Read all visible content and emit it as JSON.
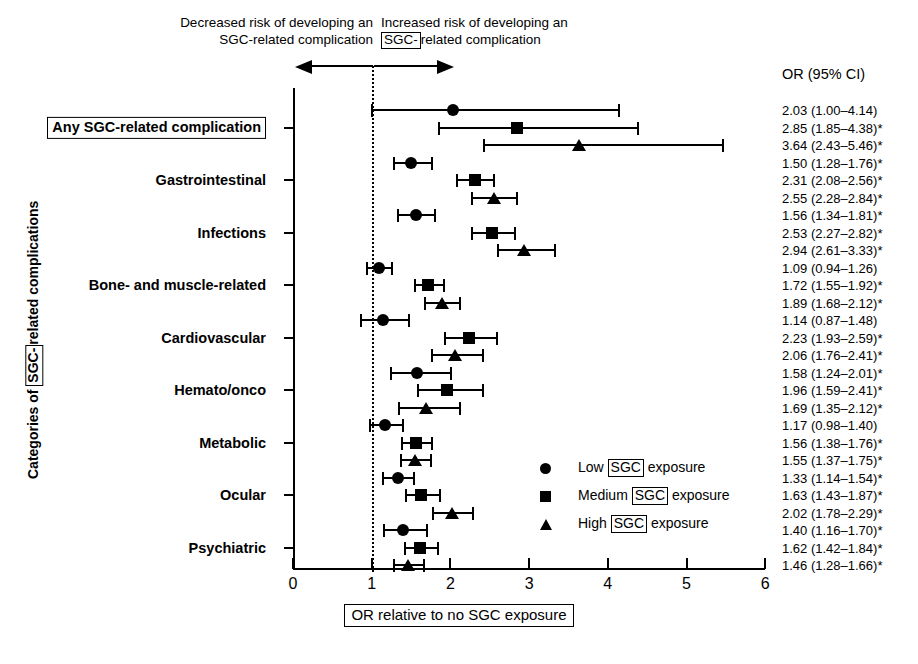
{
  "header": {
    "left_line1": "Decreased risk of developing an",
    "left_line2_pre": "SGC-related complication",
    "right_line1": "Increased risk of developing an",
    "right_boxed": "SGC-",
    "right_after": "related complication"
  },
  "axes": {
    "x_title_text": "OR relative to no SGC exposure",
    "y_title_pre": "Categories of ",
    "y_title_boxed": "SGC-",
    "y_title_post": "related complications",
    "x_ticks": [
      "0",
      "1",
      "2",
      "3",
      "4",
      "5",
      "6"
    ],
    "x_min": 0,
    "x_max": 6,
    "reference_value": 1
  },
  "or_column": {
    "header": "OR (95% CI)"
  },
  "legend": {
    "items": [
      {
        "marker": "circle-marker",
        "pre": "Low ",
        "boxed": "SGC",
        "post": " exposure"
      },
      {
        "marker": "square-marker",
        "pre": "Medium ",
        "boxed": "SGC",
        "post": " exposure"
      },
      {
        "marker": "triangle-marker",
        "pre": "High ",
        "boxed": "SGC",
        "post": " exposure"
      }
    ]
  },
  "chart_data": {
    "type": "scatter",
    "title": "",
    "xlabel": "OR relative to no SGC exposure",
    "ylabel": "Categories of SGC-related complications",
    "xlim": [
      0,
      6
    ],
    "grid": false,
    "reference_line": 1,
    "legend_position": "inside-right",
    "series": [
      {
        "name": "Low SGC exposure",
        "marker": "circle"
      },
      {
        "name": "Medium SGC exposure",
        "marker": "square"
      },
      {
        "name": "High SGC exposure",
        "marker": "triangle"
      }
    ],
    "categories": [
      "Any SGC-related complication",
      "Gastrointestinal",
      "Infections",
      "Bone- and muscle-related",
      "Cardiovascular",
      "Hemato/onco",
      "Metabolic",
      "Ocular",
      "Psychiatric"
    ],
    "groups": [
      {
        "category": "Any SGC-related complication",
        "boxed_label": true,
        "rows": [
          {
            "series": "Low SGC exposure",
            "or": 2.03,
            "ci_low": 1.0,
            "ci_high": 4.14,
            "significant": false,
            "text": "2.03 (1.00–4.14)"
          },
          {
            "series": "Medium SGC exposure",
            "or": 2.85,
            "ci_low": 1.85,
            "ci_high": 4.38,
            "significant": true,
            "text": "2.85 (1.85–4.38)*"
          },
          {
            "series": "High SGC exposure",
            "or": 3.64,
            "ci_low": 2.43,
            "ci_high": 5.46,
            "significant": true,
            "text": "3.64 (2.43–5.46)*"
          }
        ]
      },
      {
        "category": "Gastrointestinal",
        "boxed_label": false,
        "rows": [
          {
            "series": "Low SGC exposure",
            "or": 1.5,
            "ci_low": 1.28,
            "ci_high": 1.76,
            "significant": true,
            "text": "1.50 (1.28–1.76)*"
          },
          {
            "series": "Medium SGC exposure",
            "or": 2.31,
            "ci_low": 2.08,
            "ci_high": 2.56,
            "significant": true,
            "text": "2.31 (2.08–2.56)*"
          },
          {
            "series": "High SGC exposure",
            "or": 2.55,
            "ci_low": 2.28,
            "ci_high": 2.84,
            "significant": true,
            "text": "2.55 (2.28–2.84)*"
          }
        ]
      },
      {
        "category": "Infections",
        "boxed_label": false,
        "rows": [
          {
            "series": "Low SGC exposure",
            "or": 1.56,
            "ci_low": 1.34,
            "ci_high": 1.81,
            "significant": true,
            "text": "1.56 (1.34–1.81)*"
          },
          {
            "series": "Medium SGC exposure",
            "or": 2.53,
            "ci_low": 2.27,
            "ci_high": 2.82,
            "significant": true,
            "text": "2.53 (2.27–2.82)*"
          },
          {
            "series": "High SGC exposure",
            "or": 2.94,
            "ci_low": 2.61,
            "ci_high": 3.33,
            "significant": true,
            "text": "2.94 (2.61–3.33)*"
          }
        ]
      },
      {
        "category": "Bone- and muscle-related",
        "boxed_label": false,
        "rows": [
          {
            "series": "Low SGC exposure",
            "or": 1.09,
            "ci_low": 0.94,
            "ci_high": 1.26,
            "significant": false,
            "text": "1.09 (0.94–1.26)"
          },
          {
            "series": "Medium SGC exposure",
            "or": 1.72,
            "ci_low": 1.55,
            "ci_high": 1.92,
            "significant": true,
            "text": "1.72 (1.55–1.92)*"
          },
          {
            "series": "High SGC exposure",
            "or": 1.89,
            "ci_low": 1.68,
            "ci_high": 2.12,
            "significant": true,
            "text": "1.89 (1.68–2.12)*"
          }
        ]
      },
      {
        "category": "Cardiovascular",
        "boxed_label": false,
        "rows": [
          {
            "series": "Low SGC exposure",
            "or": 1.14,
            "ci_low": 0.87,
            "ci_high": 1.48,
            "significant": false,
            "text": "1.14 (0.87–1.48)"
          },
          {
            "series": "Medium SGC exposure",
            "or": 2.23,
            "ci_low": 1.93,
            "ci_high": 2.59,
            "significant": true,
            "text": "2.23 (1.93–2.59)*"
          },
          {
            "series": "High SGC exposure",
            "or": 2.06,
            "ci_low": 1.76,
            "ci_high": 2.41,
            "significant": true,
            "text": "2.06 (1.76–2.41)*"
          }
        ]
      },
      {
        "category": "Hemato/onco",
        "boxed_label": false,
        "rows": [
          {
            "series": "Low SGC exposure",
            "or": 1.58,
            "ci_low": 1.24,
            "ci_high": 2.01,
            "significant": true,
            "text": "1.58 (1.24–2.01)*"
          },
          {
            "series": "Medium SGC exposure",
            "or": 1.96,
            "ci_low": 1.59,
            "ci_high": 2.41,
            "significant": true,
            "text": "1.96 (1.59–2.41)*"
          },
          {
            "series": "High SGC exposure",
            "or": 1.69,
            "ci_low": 1.35,
            "ci_high": 2.12,
            "significant": true,
            "text": "1.69 (1.35–2.12)*"
          }
        ]
      },
      {
        "category": "Metabolic",
        "boxed_label": false,
        "rows": [
          {
            "series": "Low SGC exposure",
            "or": 1.17,
            "ci_low": 0.98,
            "ci_high": 1.4,
            "significant": false,
            "text": "1.17 (0.98–1.40)"
          },
          {
            "series": "Medium SGC exposure",
            "or": 1.56,
            "ci_low": 1.38,
            "ci_high": 1.76,
            "significant": true,
            "text": "1.56 (1.38–1.76)*"
          },
          {
            "series": "High SGC exposure",
            "or": 1.55,
            "ci_low": 1.37,
            "ci_high": 1.75,
            "significant": true,
            "text": "1.55 (1.37–1.75)*"
          }
        ]
      },
      {
        "category": "Ocular",
        "boxed_label": false,
        "rows": [
          {
            "series": "Low SGC exposure",
            "or": 1.33,
            "ci_low": 1.14,
            "ci_high": 1.54,
            "significant": true,
            "text": "1.33 (1.14–1.54)*"
          },
          {
            "series": "Medium SGC exposure",
            "or": 1.63,
            "ci_low": 1.43,
            "ci_high": 1.87,
            "significant": true,
            "text": "1.63 (1.43–1.87)*"
          },
          {
            "series": "High SGC exposure",
            "or": 2.02,
            "ci_low": 1.78,
            "ci_high": 2.29,
            "significant": true,
            "text": "2.02 (1.78–2.29)*"
          }
        ]
      },
      {
        "category": "Psychiatric",
        "boxed_label": false,
        "rows": [
          {
            "series": "Low SGC exposure",
            "or": 1.4,
            "ci_low": 1.16,
            "ci_high": 1.7,
            "significant": true,
            "text": "1.40 (1.16–1.70)*"
          },
          {
            "series": "Medium SGC exposure",
            "or": 1.62,
            "ci_low": 1.42,
            "ci_high": 1.84,
            "significant": true,
            "text": "1.62 (1.42–1.84)*"
          },
          {
            "series": "High SGC exposure",
            "or": 1.46,
            "ci_low": 1.28,
            "ci_high": 1.66,
            "significant": true,
            "text": "1.46 (1.28–1.66)*"
          }
        ]
      }
    ]
  }
}
